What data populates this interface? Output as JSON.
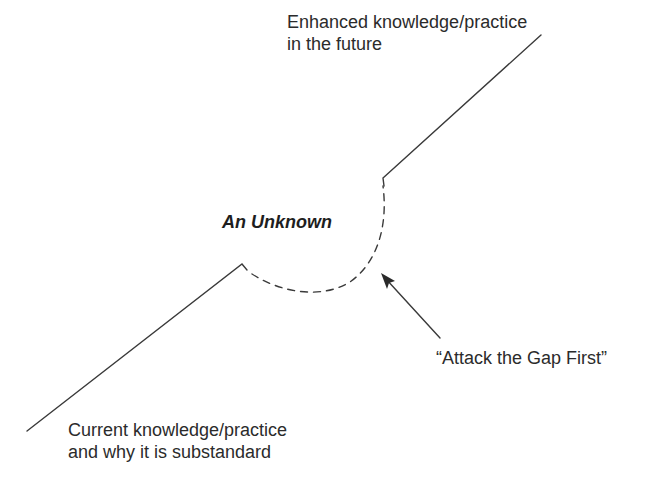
{
  "diagram": {
    "type": "concept-gap-diagram",
    "colors": {
      "line": "#3a3a3a",
      "text": "#2b2b2b",
      "background": "#ffffff"
    },
    "labels": {
      "future_line1": "Enhanced knowledge/practice",
      "future_line2": "in the future",
      "current_line1": "Current knowledge/practice",
      "current_line2": "and why it is substandard",
      "unknown": "An Unknown",
      "gap": "“Attack the Gap First”"
    },
    "elements": [
      {
        "id": "current-line",
        "style": "solid",
        "description": "rising line from bottom-left to the gap"
      },
      {
        "id": "gap-arc",
        "style": "dashed",
        "description": "curved dashed arc representing the unknown gap"
      },
      {
        "id": "future-line",
        "style": "solid",
        "description": "rising line from the gap to top-right"
      },
      {
        "id": "gap-arrow",
        "style": "arrow",
        "description": "arrow pointing at the gap arc"
      }
    ]
  }
}
